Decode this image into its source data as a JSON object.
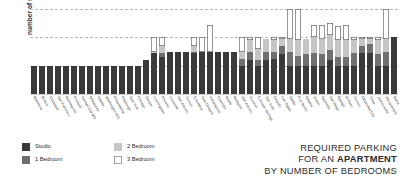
{
  "chart_data": {
    "type": "bar",
    "title": "REQUIRED PARKING FOR AN APARTMENT BY NUMBER OF BEDROOMS",
    "title_lines": [
      "REQUIRED PARKING",
      "FOR AN ",
      "APARTMENT",
      "BY NUMBER OF BEDROOMS"
    ],
    "xlabel": "",
    "ylabel": "number of spaces",
    "ylim": [
      0,
      3
    ],
    "yticks": [
      0,
      1,
      2,
      3
    ],
    "ytick_labels": [
      "0",
      "1",
      "2",
      "3"
    ],
    "grid": true,
    "stacked": true,
    "legend_position": "bottom-left",
    "categories": [
      "Baltimore",
      "Boston",
      "Cleveland",
      "San Francisco",
      "Minneapolis",
      "Portland",
      "Kansas City MO",
      "Milwaukee",
      "Seattle",
      "Washington D.C.",
      "Philadelphia",
      "Pittsburgh",
      "New York",
      "Chicago",
      "Denver",
      "Los Angeles",
      "Phoenix",
      "Louisville",
      "San Antonio",
      "Tucson",
      "Columbus",
      "New Orleans",
      "Indianapolis",
      "Charlotte",
      "Miami",
      "Memphis",
      "San Antonio",
      "Houston",
      "Colorado Springs",
      "San Jose",
      "Orlando",
      "Las Vegas",
      "Dallas",
      "Fort Worth",
      "Omaha",
      "Austin",
      "Nashville",
      "San Diego",
      "Raleigh",
      "El Paso",
      "Tucson",
      "Oklahoma City",
      "Tulsa",
      "Jacksonville",
      "Albuquerque",
      "Mesa"
    ],
    "series": [
      {
        "name": "Studio",
        "color": "#3a3a3a",
        "values": [
          1,
          1,
          1,
          1,
          1,
          1,
          1,
          1,
          1,
          1,
          1,
          1,
          1,
          1,
          1.2,
          1.45,
          1.3,
          1.5,
          1.5,
          1.5,
          1.45,
          1.5,
          1.5,
          1.5,
          1.5,
          1.5,
          1,
          1.2,
          1,
          1.2,
          1.25,
          1.4,
          1,
          1,
          1,
          1,
          1,
          1.2,
          1,
          1,
          1,
          1.45,
          1.45,
          1,
          1,
          2
        ]
      },
      {
        "name": "1 Bedroom",
        "color": "#6f6f6f",
        "values": [
          0,
          0,
          0,
          0,
          0,
          0,
          0,
          0,
          0,
          0,
          0,
          0,
          0,
          0,
          0,
          0,
          0.15,
          0,
          0,
          0,
          0.05,
          0,
          0,
          0,
          0,
          0,
          0.25,
          0.3,
          0.2,
          0.3,
          0.25,
          0.3,
          0.5,
          0.35,
          0.4,
          0.45,
          0.4,
          0.35,
          0.3,
          0.3,
          0.45,
          0.25,
          0.3,
          0.4,
          0.5,
          0
        ]
      },
      {
        "name": "2 Bedroom",
        "color": "#c6c6c6",
        "values": [
          0,
          0,
          0,
          0,
          0,
          0,
          0,
          0,
          0,
          0,
          0,
          0,
          0,
          0,
          0,
          0.05,
          0.25,
          0,
          0,
          0,
          0.2,
          0,
          0,
          0,
          0,
          0,
          0.25,
          0.4,
          0.4,
          0.45,
          0.4,
          0.25,
          0.45,
          0.55,
          0.55,
          0.55,
          0.55,
          0.55,
          0.6,
          0.6,
          0.45,
          0.25,
          0.2,
          0.5,
          0.45,
          0
        ]
      },
      {
        "name": "3 Bedroom",
        "color": "#ffffff",
        "values": [
          0,
          0,
          0,
          0,
          0,
          0,
          0,
          0,
          0,
          0,
          0,
          0,
          0,
          0,
          0,
          0.5,
          0.3,
          0,
          0,
          0,
          0.3,
          0.5,
          0.95,
          0,
          0,
          0,
          0.5,
          0.1,
          0.4,
          0,
          0.1,
          0.05,
          1.05,
          1.1,
          0,
          0.45,
          0.5,
          0.4,
          0.5,
          0.55,
          0.1,
          0.05,
          0.05,
          0.1,
          1.05,
          0
        ]
      }
    ],
    "totals": [
      1,
      1,
      1,
      1,
      1,
      1,
      1,
      1,
      1,
      1,
      1,
      1,
      1,
      1,
      1.2,
      2,
      2,
      1.5,
      1.5,
      1.5,
      2,
      2,
      2.45,
      1.5,
      1.5,
      1.5,
      2,
      2,
      2,
      1.95,
      2,
      2,
      3,
      3,
      1.95,
      2.45,
      2.45,
      2.5,
      2.4,
      2.45,
      2,
      2,
      2,
      2,
      2,
      2
    ]
  },
  "legend": {
    "items": [
      {
        "label": "Studio",
        "swatch": "studio"
      },
      {
        "label": "1 Bedroom",
        "swatch": "br1"
      },
      {
        "label": "2 Bedroom",
        "swatch": "br2"
      },
      {
        "label": "3 Bedroom",
        "swatch": "br3"
      }
    ]
  },
  "title": {
    "line1": "REQUIRED PARKING",
    "line2_prefix": "FOR AN ",
    "line2_strong": "APARTMENT",
    "line3": "BY NUMBER OF BEDROOMS"
  }
}
